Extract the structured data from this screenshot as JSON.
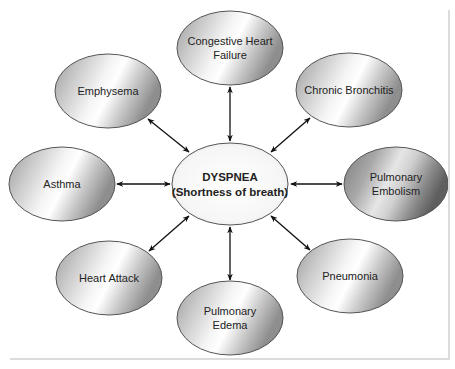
{
  "diagram": {
    "center": {
      "title": "DYSPNEA",
      "subtitle": "(Shortness of breath)",
      "cx": 230,
      "cy": 184,
      "rx": 58,
      "ry": 41
    },
    "nodes": [
      {
        "id": "chf",
        "lines": [
          "Congestive Heart",
          "Failure"
        ],
        "cx": 230,
        "cy": 48,
        "rx": 53,
        "ry": 37,
        "shade": "light"
      },
      {
        "id": "chronic-bronchitis",
        "lines": [
          "Chronic Bronchitis"
        ],
        "cx": 349,
        "cy": 90,
        "rx": 53,
        "ry": 37,
        "shade": "light"
      },
      {
        "id": "pulmonary-embolism",
        "lines": [
          "Pulmonary",
          "Embolism"
        ],
        "cx": 396,
        "cy": 184,
        "rx": 52,
        "ry": 37,
        "shade": "dark"
      },
      {
        "id": "pneumonia",
        "lines": [
          "Pneumonia"
        ],
        "cx": 350,
        "cy": 276,
        "rx": 53,
        "ry": 37,
        "shade": "light"
      },
      {
        "id": "pulmonary-edema",
        "lines": [
          "Pulmonary",
          "Edema"
        ],
        "cx": 230,
        "cy": 318,
        "rx": 53,
        "ry": 37,
        "shade": "light"
      },
      {
        "id": "heart-attack",
        "lines": [
          "Heart Attack"
        ],
        "cx": 109,
        "cy": 278,
        "rx": 53,
        "ry": 37,
        "shade": "light"
      },
      {
        "id": "asthma",
        "lines": [
          "Asthma"
        ],
        "cx": 62,
        "cy": 184,
        "rx": 53,
        "ry": 37,
        "shade": "light"
      },
      {
        "id": "emphysema",
        "lines": [
          "Emphysema"
        ],
        "cx": 108,
        "cy": 91,
        "rx": 53,
        "ry": 37,
        "shade": "light"
      }
    ],
    "arrows": [
      {
        "to": "chf",
        "x1": 230,
        "y1": 87,
        "x2": 230,
        "y2": 141
      },
      {
        "to": "chronic-bronchitis",
        "x1": 310,
        "y1": 118,
        "x2": 271,
        "y2": 152
      },
      {
        "to": "pulmonary-embolism",
        "x1": 291,
        "y1": 184,
        "x2": 342,
        "y2": 184
      },
      {
        "to": "pneumonia",
        "x1": 271,
        "y1": 216,
        "x2": 310,
        "y2": 250
      },
      {
        "to": "pulmonary-edema",
        "x1": 230,
        "y1": 227,
        "x2": 230,
        "y2": 280
      },
      {
        "to": "heart-attack",
        "x1": 189,
        "y1": 216,
        "x2": 149,
        "y2": 251
      },
      {
        "to": "asthma",
        "x1": 117,
        "y1": 184,
        "x2": 170,
        "y2": 184
      },
      {
        "to": "emphysema",
        "x1": 148,
        "y1": 119,
        "x2": 189,
        "y2": 152
      }
    ],
    "colors": {
      "outline": "#555555",
      "arrow": "#111111",
      "text": "#222222",
      "frame": "#dcdcdc"
    }
  }
}
